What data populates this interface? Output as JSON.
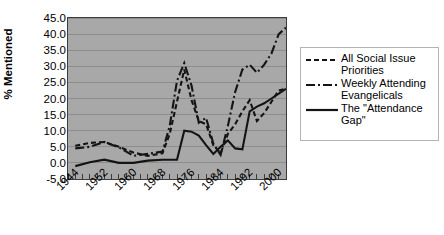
{
  "chart_data": {
    "type": "line",
    "title": "",
    "xlabel": "",
    "ylabel": "% Mentioned",
    "ylim": [
      -5.0,
      45.0
    ],
    "xlim": [
      1944,
      2004
    ],
    "grid": true,
    "legend_position": "right",
    "y_ticks": [
      "45.0",
      "40.0",
      "35.0",
      "30.0",
      "25.0",
      "20.0",
      "15.0",
      "10.0",
      "5.0",
      "0.0",
      "-5.0"
    ],
    "y_tick_values": [
      45.0,
      40.0,
      35.0,
      30.0,
      25.0,
      20.0,
      15.0,
      10.0,
      5.0,
      0.0,
      -5.0
    ],
    "x_ticks": [
      "1944",
      "1952",
      "1960",
      "1968",
      "1976",
      "1984",
      "1992",
      "2000"
    ],
    "x_tick_values": [
      1944,
      1952,
      1960,
      1968,
      1976,
      1984,
      1992,
      2000
    ],
    "x_minor_step": 2,
    "series": [
      {
        "name": "All Social Issue Priorities",
        "style": "dashed",
        "color": "#141414",
        "x": [
          1946,
          1950,
          1954,
          1958,
          1962,
          1966,
          1970,
          1972,
          1974,
          1976,
          1978,
          1980,
          1982,
          1984,
          1986,
          1988,
          1990,
          1992,
          1994,
          1996,
          1998,
          2000,
          2002,
          2004
        ],
        "values": [
          5.3,
          6.2,
          6.5,
          5.0,
          3.2,
          2.2,
          3.0,
          9.0,
          19.0,
          29.0,
          19.5,
          13.0,
          12.0,
          5.5,
          3.0,
          9.0,
          12.0,
          16.0,
          19.5,
          13.0,
          15.5,
          19.0,
          22.5,
          23.0
        ]
      },
      {
        "name": "Weekly Attending Evangelicals",
        "style": "dashdot",
        "color": "#141414",
        "x": [
          1946,
          1950,
          1954,
          1958,
          1962,
          1966,
          1970,
          1972,
          1974,
          1976,
          1978,
          1980,
          1982,
          1984,
          1986,
          1988,
          1990,
          1992,
          1994,
          1996,
          1998,
          2000,
          2002,
          2004
        ],
        "values": [
          4.5,
          5.0,
          6.5,
          4.8,
          2.2,
          2.8,
          3.5,
          11.5,
          25.5,
          31.0,
          24.0,
          12.5,
          14.0,
          6.0,
          2.5,
          11.5,
          22.0,
          29.0,
          30.5,
          28.0,
          30.5,
          34.0,
          40.0,
          42.0
        ]
      },
      {
        "name": "The \"Attendance Gap\"",
        "style": "solid",
        "color": "#141414",
        "x": [
          1946,
          1950,
          1954,
          1958,
          1962,
          1966,
          1970,
          1972,
          1974,
          1976,
          1978,
          1980,
          1982,
          1984,
          1986,
          1988,
          1990,
          1992,
          1994,
          1996,
          1998,
          2000,
          2002,
          2004
        ],
        "values": [
          -1.0,
          0.2,
          1.0,
          0.0,
          0.0,
          0.7,
          1.0,
          1.0,
          1.0,
          10.0,
          9.7,
          8.5,
          5.5,
          2.8,
          5.0,
          7.0,
          4.5,
          4.2,
          16.0,
          17.5,
          18.5,
          20.0,
          21.5,
          23.0
        ]
      }
    ]
  },
  "legend": {
    "items": [
      {
        "label": "All Social Issue\nPriorities",
        "style": "dashed"
      },
      {
        "label": "Weekly Attending\nEvangelicals",
        "style": "dashdot"
      },
      {
        "label": "The \"Attendance\nGap\"",
        "style": "solid"
      }
    ]
  },
  "axis": {
    "y_title": "% Mentioned"
  }
}
